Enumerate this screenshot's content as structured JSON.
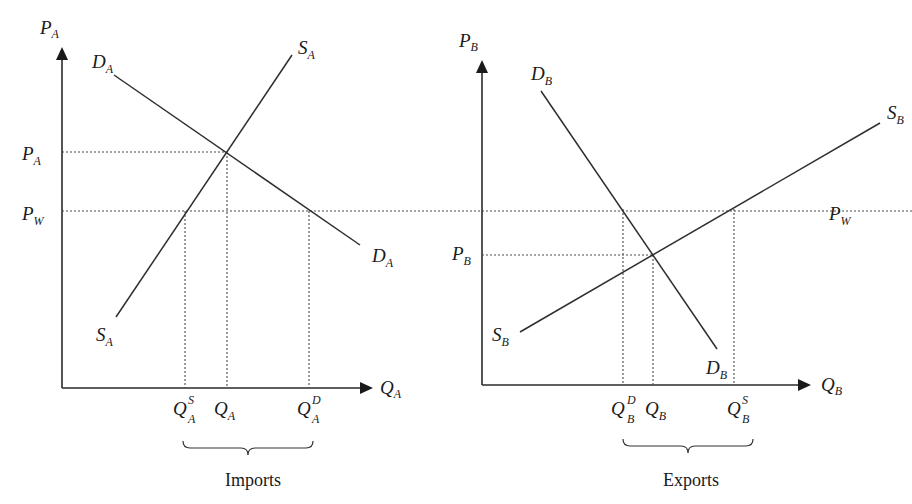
{
  "diagram": {
    "panels": [
      {
        "id": "country-a",
        "axes": {
          "y_label": {
            "main": "P",
            "sub": "A"
          },
          "x_label": {
            "main": "Q",
            "sub": "A"
          }
        },
        "curves": {
          "demand": {
            "main": "D",
            "sub": "A"
          },
          "supply": {
            "main": "S",
            "sub": "A"
          }
        },
        "price_ticks": [
          {
            "main": "P",
            "sub": "A"
          },
          {
            "main": "P",
            "sub": "W"
          }
        ],
        "quantity_ticks": [
          {
            "main": "Q",
            "sub": "A",
            "sup": "S"
          },
          {
            "main": "Q",
            "sub": "A",
            "sup": ""
          },
          {
            "main": "Q",
            "sub": "A",
            "sup": "D"
          }
        ],
        "brace_caption": "Imports"
      },
      {
        "id": "country-b",
        "axes": {
          "y_label": {
            "main": "P",
            "sub": "B"
          },
          "x_label": {
            "main": "Q",
            "sub": "B"
          }
        },
        "curves": {
          "demand": {
            "main": "D",
            "sub": "B"
          },
          "supply": {
            "main": "S",
            "sub": "B"
          }
        },
        "price_ticks": [
          {
            "main": "P",
            "sub": "B"
          },
          {
            "main": "P",
            "sub": "W"
          }
        ],
        "quantity_ticks": [
          {
            "main": "Q",
            "sub": "B",
            "sup": "D"
          },
          {
            "main": "Q",
            "sub": "B",
            "sup": ""
          },
          {
            "main": "Q",
            "sub": "B",
            "sup": "S"
          }
        ],
        "brace_caption": "Exports"
      }
    ]
  }
}
